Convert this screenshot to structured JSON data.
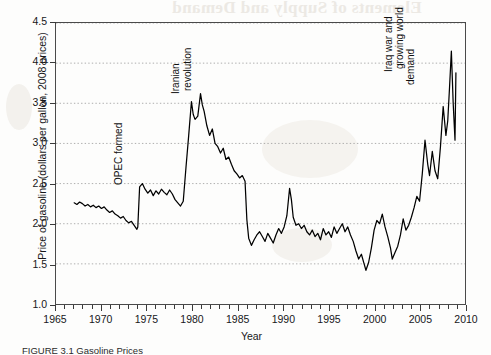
{
  "figure": {
    "bleed_through_text": "Elements of Supply and Demand",
    "caption": "FIGURE 3.1  Gasoline Prices",
    "annotations": [
      {
        "id": "opec",
        "text": "OPEC formed",
        "year": 1973.0,
        "value": 2.62
      },
      {
        "id": "iran1",
        "text": "Iranian",
        "year": 1979.2,
        "value": 3.75
      },
      {
        "id": "iran2",
        "text": "revolution",
        "year": 1980.6,
        "value": 3.78
      },
      {
        "id": "iraq1",
        "text": "Iraq war and",
        "year": 2002.6,
        "value": 4.02
      },
      {
        "id": "iraq2",
        "text": "growing world",
        "year": 2003.8,
        "value": 4.05
      },
      {
        "id": "iraq3",
        "text": "demand",
        "year": 2005.0,
        "value": 3.86
      }
    ]
  },
  "chart_data": {
    "type": "line",
    "title": "",
    "xlabel": "Year",
    "ylabel": "Price of gasoline (dollars per gallon, 2008 prices)",
    "xlim": [
      1965,
      2010
    ],
    "ylim": [
      1.0,
      4.5
    ],
    "xticks": [
      1965,
      1970,
      1975,
      1980,
      1985,
      1990,
      1995,
      2000,
      2005,
      2010
    ],
    "xtick_labels": [
      "1965",
      "1970",
      "1975",
      "1980",
      "1985",
      "1990",
      "1995",
      "2000",
      "2005",
      "2010"
    ],
    "x_minor_tick_step": 1,
    "yticks": [
      1.0,
      1.5,
      2.0,
      2.5,
      3.0,
      3.5,
      4.0,
      4.5
    ],
    "ytick_labels": [
      "1.0",
      "1.5",
      "2.0",
      "2.5",
      "3.0",
      "3.5",
      "4.0",
      "4.5"
    ],
    "grid": "horizontal-dotted",
    "legend": "none",
    "series": [
      {
        "name": "Price of gasoline (2008 dollars per gallon)",
        "color": "#000000",
        "x": [
          1967.0,
          1967.3,
          1967.6,
          1967.9,
          1968.2,
          1968.5,
          1968.8,
          1969.1,
          1969.4,
          1969.7,
          1970.0,
          1970.3,
          1970.6,
          1970.9,
          1971.2,
          1971.5,
          1971.8,
          1972.1,
          1972.4,
          1972.7,
          1973.0,
          1973.3,
          1973.6,
          1973.9,
          1974.0,
          1974.2,
          1974.5,
          1974.8,
          1975.1,
          1975.4,
          1975.7,
          1976.0,
          1976.3,
          1976.6,
          1976.9,
          1977.2,
          1977.5,
          1977.8,
          1978.1,
          1978.4,
          1978.7,
          1979.0,
          1979.3,
          1979.6,
          1979.9,
          1980.1,
          1980.3,
          1980.6,
          1980.9,
          1981.1,
          1981.3,
          1981.6,
          1981.9,
          1982.2,
          1982.5,
          1982.8,
          1983.1,
          1983.4,
          1983.7,
          1984.0,
          1984.3,
          1984.6,
          1984.9,
          1985.2,
          1985.5,
          1985.8,
          1986.0,
          1986.2,
          1986.5,
          1986.8,
          1987.1,
          1987.4,
          1987.7,
          1988.0,
          1988.3,
          1988.6,
          1988.9,
          1989.2,
          1989.5,
          1989.8,
          1990.1,
          1990.4,
          1990.7,
          1990.9,
          1991.1,
          1991.4,
          1991.7,
          1992.0,
          1992.3,
          1992.6,
          1992.9,
          1993.2,
          1993.5,
          1993.8,
          1994.1,
          1994.4,
          1994.7,
          1995.0,
          1995.3,
          1995.6,
          1995.9,
          1996.2,
          1996.5,
          1996.8,
          1997.1,
          1997.4,
          1997.7,
          1998.0,
          1998.3,
          1998.6,
          1998.9,
          1999.1,
          1999.4,
          1999.7,
          2000.0,
          2000.3,
          2000.6,
          2000.9,
          2001.2,
          2001.5,
          2001.8,
          2002.0,
          2002.3,
          2002.6,
          2002.9,
          2003.2,
          2003.5,
          2003.8,
          2004.1,
          2004.4,
          2004.7,
          2005.0,
          2005.3,
          2005.6,
          2005.9,
          2006.1,
          2006.4,
          2006.7,
          2007.0,
          2007.3,
          2007.6,
          2007.9,
          2008.1,
          2008.3,
          2008.5,
          2008.7,
          2008.9,
          2009.0
        ],
        "y": [
          2.26,
          2.24,
          2.27,
          2.25,
          2.22,
          2.24,
          2.21,
          2.23,
          2.2,
          2.22,
          2.19,
          2.21,
          2.17,
          2.14,
          2.16,
          2.12,
          2.1,
          2.07,
          2.09,
          2.04,
          2.01,
          2.03,
          1.98,
          1.93,
          1.96,
          2.46,
          2.5,
          2.43,
          2.38,
          2.42,
          2.35,
          2.41,
          2.37,
          2.43,
          2.39,
          2.36,
          2.42,
          2.37,
          2.3,
          2.26,
          2.22,
          2.28,
          2.7,
          3.1,
          3.52,
          3.36,
          3.3,
          3.34,
          3.62,
          3.48,
          3.4,
          3.22,
          3.1,
          3.18,
          3.0,
          2.96,
          2.88,
          2.94,
          2.8,
          2.83,
          2.74,
          2.66,
          2.62,
          2.57,
          2.6,
          2.53,
          2.05,
          1.82,
          1.73,
          1.8,
          1.86,
          1.9,
          1.84,
          1.78,
          1.88,
          1.82,
          1.76,
          1.86,
          1.94,
          1.88,
          1.96,
          2.1,
          2.44,
          2.3,
          2.08,
          1.98,
          2.0,
          1.94,
          1.98,
          1.9,
          1.86,
          1.92,
          1.84,
          1.88,
          1.8,
          1.94,
          1.86,
          1.9,
          1.83,
          1.96,
          1.88,
          1.94,
          2.0,
          1.9,
          1.96,
          1.86,
          1.78,
          1.66,
          1.56,
          1.62,
          1.5,
          1.42,
          1.52,
          1.7,
          1.92,
          2.04,
          2.0,
          2.12,
          1.96,
          1.84,
          1.7,
          1.56,
          1.64,
          1.72,
          1.86,
          2.06,
          1.92,
          1.98,
          2.08,
          2.2,
          2.34,
          2.28,
          2.62,
          3.04,
          2.74,
          2.6,
          2.9,
          2.66,
          2.56,
          2.96,
          3.46,
          3.1,
          3.28,
          3.7,
          4.15,
          3.5,
          3.04,
          3.88
        ]
      }
    ]
  }
}
